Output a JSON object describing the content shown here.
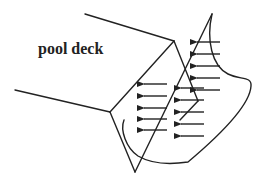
{
  "diagram": {
    "label": "pool deck",
    "label_pos": {
      "x": 63,
      "y": 39
    },
    "stroke_color": "#222222",
    "arrows": {
      "direction": "left",
      "groups": [
        {
          "name": "upper-right-group",
          "items": [
            [
              220,
              42,
              197,
              42
            ],
            [
              220,
              54,
              197,
              54
            ],
            [
              220,
              66,
              197,
              66
            ],
            [
              220,
              78,
              197,
              78
            ],
            [
              220,
              90,
              197,
              90
            ]
          ]
        },
        {
          "name": "middle-group",
          "items": [
            [
              204,
              88,
              181,
              88
            ],
            [
              204,
              100,
              181,
              100
            ],
            [
              204,
              112,
              181,
              112
            ],
            [
              204,
              124,
              181,
              124
            ],
            [
              204,
              136,
              181,
              136
            ]
          ]
        },
        {
          "name": "left-group",
          "items": [
            [
              167,
              84,
              144,
              84
            ],
            [
              167,
              96,
              144,
              96
            ],
            [
              167,
              108,
              144,
              108
            ],
            [
              167,
              119,
              144,
              119
            ],
            [
              167,
              130,
              144,
              130
            ]
          ]
        }
      ]
    }
  }
}
